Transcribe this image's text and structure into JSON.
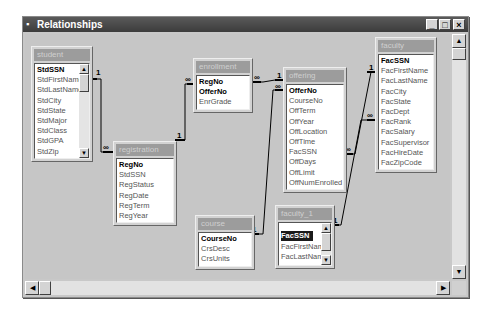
{
  "window": {
    "title": "Relationships",
    "controls": {
      "minimize": "_",
      "maximize": "□",
      "close": "×"
    }
  },
  "tables": {
    "student": {
      "name": "student",
      "fields": [
        "StdSSN",
        "StdFirstName",
        "StdLastName",
        "StdCity",
        "StdState",
        "StdMajor",
        "StdClass",
        "StdGPA",
        "StdZip"
      ],
      "keys": [
        "StdSSN"
      ]
    },
    "registration": {
      "name": "registration",
      "fields": [
        "RegNo",
        "StdSSN",
        "RegStatus",
        "RegDate",
        "RegTerm",
        "RegYear"
      ],
      "keys": [
        "RegNo"
      ]
    },
    "enrollment": {
      "name": "enrollment",
      "fields": [
        "RegNo",
        "OfferNo",
        "EnrGrade"
      ],
      "keys": [
        "RegNo",
        "OfferNo"
      ]
    },
    "offering": {
      "name": "offering",
      "fields": [
        "OfferNo",
        "CourseNo",
        "OffTerm",
        "OffYear",
        "OffLocation",
        "OffTime",
        "FacSSN",
        "OffDays",
        "OffLimit",
        "OffNumEnrolled"
      ],
      "keys": [
        "OfferNo"
      ]
    },
    "faculty": {
      "name": "faculty",
      "fields": [
        "FacSSN",
        "FacFirstName",
        "FacLastName",
        "FacCity",
        "FacState",
        "FacDept",
        "FacRank",
        "FacSalary",
        "FacSupervisor",
        "FacHireDate",
        "FacZipCode"
      ],
      "keys": [
        "FacSSN"
      ]
    },
    "course": {
      "name": "course",
      "fields": [
        "CourseNo",
        "CrsDesc",
        "CrsUnits"
      ],
      "keys": [
        "CourseNo"
      ]
    },
    "faculty_1": {
      "name": "faculty_1",
      "fields": [
        "FacSSN",
        "FacFirstName",
        "FacLastName"
      ],
      "keys": [
        "FacSSN"
      ],
      "selected": "FacSSN"
    }
  },
  "relationships": [
    {
      "from": "student.StdSSN",
      "to": "registration.StdSSN",
      "one": "1",
      "many": "∞"
    },
    {
      "from": "registration.RegNo",
      "to": "enrollment.RegNo",
      "one": "1",
      "many": "∞"
    },
    {
      "from": "offering.OfferNo",
      "to": "enrollment.OfferNo",
      "one": "1",
      "many": "∞"
    },
    {
      "from": "course.CourseNo",
      "to": "offering.CourseNo",
      "one": "1",
      "many": "∞"
    },
    {
      "from": "faculty.FacSSN",
      "to": "offering.FacSSN",
      "one": "1",
      "many": "∞"
    },
    {
      "from": "faculty_1.FacSSN",
      "to": "faculty.FacSupervisor",
      "one": "1",
      "many": "∞"
    }
  ],
  "labels": {
    "one": "1",
    "many": "∞"
  }
}
